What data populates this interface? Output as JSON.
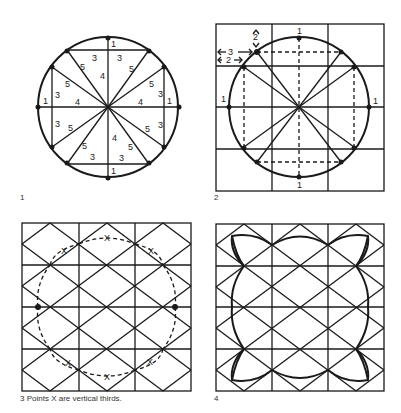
{
  "figure": {
    "panels": [
      {
        "number": "1",
        "description": "Circle divided into twelve points using 3-4-5 triangles",
        "triangle_side_labels": [
          "1",
          "3",
          "3",
          "5",
          "5",
          "4",
          "5",
          "5",
          "3",
          "1",
          "4",
          "4",
          "1",
          "3",
          "3",
          "5",
          "5",
          "4",
          "4",
          "5",
          "5",
          "3",
          "3",
          "1"
        ],
        "labels": {
          "one": "1",
          "three": "3",
          "four": "4",
          "five": "5"
        }
      },
      {
        "number": "2",
        "description": "Circle inscribed in 3x4 grid with dashed construction lines",
        "labels": {
          "top": "1",
          "left": "1",
          "right": "1",
          "bottom": "1",
          "arrow_2_vertical": "2",
          "arrow_3": "3",
          "arrow_2_horizontal": "2"
        }
      },
      {
        "number": "3",
        "caption": "3  Points X are vertical thirds.",
        "point_label": "X"
      },
      {
        "number": "4",
        "description": "Completed four-lobed pattern drawn over diamond lattice"
      }
    ],
    "colors": {
      "ink": "#1a1a1a",
      "background": "#ffffff"
    }
  }
}
